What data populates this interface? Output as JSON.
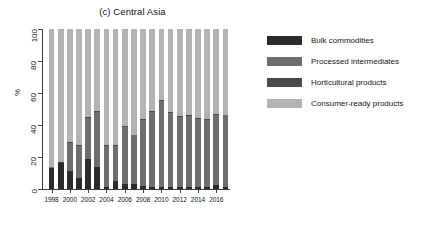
{
  "chart_data": {
    "type": "bar",
    "subtype": "stacked-bar-100pct",
    "title": "(c) Central Asia",
    "xlabel": "",
    "ylabel": "%",
    "ylim": [
      0,
      100
    ],
    "yticks": [
      0,
      20,
      40,
      60,
      80,
      100
    ],
    "grid": false,
    "legend_position": "right",
    "x": [
      1998,
      1999,
      2000,
      2001,
      2002,
      2003,
      2004,
      2005,
      2006,
      2007,
      2008,
      2009,
      2010,
      2011,
      2012,
      2013,
      2014,
      2015,
      2016,
      2017
    ],
    "xtick_labels": [
      "1998",
      "2000",
      "2002",
      "2004",
      "2006",
      "2008",
      "2010",
      "2012",
      "2014",
      "2016"
    ],
    "xtick_values": [
      1998,
      2000,
      2002,
      2004,
      2006,
      2008,
      2010,
      2012,
      2014,
      2016
    ],
    "categories": [
      "1998",
      "1999",
      "2000",
      "2001",
      "2002",
      "2003",
      "2004",
      "2005",
      "2006",
      "2007",
      "2008",
      "2009",
      "2010",
      "2011",
      "2012",
      "2013",
      "2014",
      "2015",
      "2016",
      "2017"
    ],
    "series": [
      {
        "name": "Bulk commodities",
        "color": "#2b2b2b",
        "values": [
          13,
          16,
          11,
          7,
          19,
          14,
          1.5,
          5,
          3,
          3,
          2,
          1.5,
          1.5,
          1.5,
          1.5,
          1.5,
          1.5,
          1.5,
          2.5,
          1.5
        ]
      },
      {
        "name": "Processed intermediates",
        "color": "#6e6e6e",
        "values": [
          0.5,
          0.5,
          18,
          20,
          25.5,
          34,
          25.5,
          22,
          36,
          30.5,
          41,
          46.5,
          53.5,
          46,
          43.5,
          44,
          42.5,
          41.5,
          44,
          44.5
        ]
      },
      {
        "name": "Horticultural products",
        "color": "#4a4a4a",
        "values": [
          0.5,
          0.5,
          0.5,
          0.5,
          0.5,
          0.5,
          0.5,
          0.5,
          0.5,
          0.5,
          0.5,
          0.5,
          0.5,
          0.5,
          0.5,
          0.5,
          0.5,
          0.5,
          0.5,
          0.5
        ]
      },
      {
        "name": "Consumer-ready products",
        "color": "#b3b3b3",
        "values": [
          86,
          83,
          70.5,
          72.5,
          55,
          51.5,
          72.5,
          72.5,
          60.5,
          66,
          56.5,
          51.5,
          44.5,
          52,
          54.5,
          54,
          55.5,
          56.5,
          53,
          53.5
        ]
      }
    ]
  },
  "legend": {
    "items": [
      {
        "label": "Bulk commodities",
        "color": "#2b2b2b"
      },
      {
        "label": "Processed intermediates",
        "color": "#6e6e6e"
      },
      {
        "label": "Horticultural products",
        "color": "#4a4a4a"
      },
      {
        "label": "Consumer-ready products",
        "color": "#b3b3b3"
      }
    ]
  }
}
